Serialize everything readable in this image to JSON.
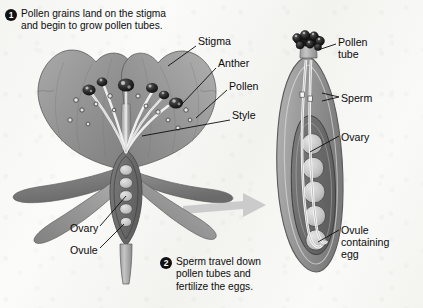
{
  "figure": {
    "background_color": "#f4f4f1",
    "ink_color": "#111111",
    "petal_color": "#9a9a9a",
    "anther_color": "#1f1f1f",
    "arrow_color": "#c9c9c9",
    "ovary_fill": "#8c8c8c"
  },
  "captions": [
    {
      "number": "1",
      "text": "Pollen grains land on the stigma\nand begin to grow pollen tubes."
    },
    {
      "number": "2",
      "text": "Sperm travel down\npollen tubes and\nfertilize the eggs."
    }
  ],
  "labels": {
    "stigma": "Stigma",
    "anther": "Anther",
    "pollen": "Pollen",
    "style": "Style",
    "ovary_left": "Ovary",
    "ovule_left": "Ovule",
    "pollen_tube": "Pollen\ntube",
    "sperm": "Sperm",
    "ovary_right": "Ovary",
    "ovule_containing_egg": "Ovule\ncontaining\negg"
  },
  "diagram_parts": {
    "left_flower": {
      "petal_count": 5,
      "stamen_count": 6,
      "ovule_count": 5,
      "pollen_grain_count": 14
    },
    "right_pistil": {
      "ovule_count": 5,
      "pollen_tube_count": 2,
      "pollen_grain_cluster_count": 7
    }
  }
}
